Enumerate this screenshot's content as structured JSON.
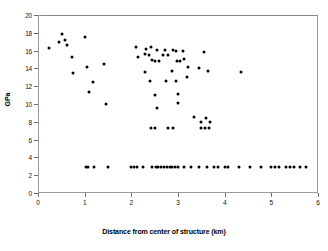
{
  "chart_data": {
    "type": "scatter",
    "title": "",
    "xlabel": "Distance from center of structure (km)",
    "ylabel": "GPa",
    "xlim": [
      0,
      6
    ],
    "ylim": [
      0,
      20
    ],
    "xticks": [
      0,
      1,
      2,
      3,
      4,
      5,
      6
    ],
    "yticks": [
      0,
      2,
      4,
      6,
      8,
      10,
      12,
      14,
      16,
      18,
      20
    ],
    "grid": false,
    "legend": null,
    "marker": "filled-circle",
    "marker_color": "#000000",
    "series": [
      {
        "name": "shock pressure",
        "points": [
          [
            0.24,
            16.25
          ],
          [
            0.46,
            17.0
          ],
          [
            0.52,
            17.9
          ],
          [
            0.58,
            17.15
          ],
          [
            0.62,
            16.6
          ],
          [
            0.72,
            15.25
          ],
          [
            0.74,
            13.45
          ],
          [
            1.0,
            17.55
          ],
          [
            1.05,
            14.15
          ],
          [
            1.1,
            11.4
          ],
          [
            1.18,
            12.5
          ],
          [
            1.42,
            14.45
          ],
          [
            1.45,
            10.0
          ],
          [
            2.1,
            16.4
          ],
          [
            2.15,
            15.25
          ],
          [
            2.3,
            15.6
          ],
          [
            2.32,
            16.2
          ],
          [
            2.38,
            15.55
          ],
          [
            2.42,
            16.45
          ],
          [
            2.45,
            14.9
          ],
          [
            2.5,
            14.85
          ],
          [
            2.55,
            16.1
          ],
          [
            2.6,
            14.85
          ],
          [
            2.68,
            15.55
          ],
          [
            2.72,
            16.1
          ],
          [
            2.78,
            15.55
          ],
          [
            2.9,
            16.1
          ],
          [
            2.95,
            15.95
          ],
          [
            2.98,
            14.85
          ],
          [
            3.05,
            14.85
          ],
          [
            3.1,
            16.0
          ],
          [
            3.12,
            15.1
          ],
          [
            3.55,
            15.85
          ],
          [
            2.3,
            13.6
          ],
          [
            2.4,
            12.6
          ],
          [
            2.5,
            11.0
          ],
          [
            2.75,
            12.6
          ],
          [
            2.88,
            13.7
          ],
          [
            2.95,
            12.55
          ],
          [
            3.0,
            11.15
          ],
          [
            3.2,
            13.05
          ],
          [
            3.22,
            14.15
          ],
          [
            3.45,
            14.0
          ],
          [
            3.65,
            13.75
          ],
          [
            4.35,
            13.6
          ],
          [
            2.55,
            9.55
          ],
          [
            3.0,
            10.1
          ],
          [
            3.35,
            8.55
          ],
          [
            3.5,
            7.95
          ],
          [
            3.6,
            8.4
          ],
          [
            3.68,
            7.95
          ],
          [
            2.42,
            7.35
          ],
          [
            2.5,
            7.35
          ],
          [
            2.78,
            7.35
          ],
          [
            2.9,
            7.35
          ],
          [
            3.5,
            7.35
          ],
          [
            3.58,
            7.35
          ],
          [
            3.66,
            7.35
          ],
          [
            1.02,
            2.95
          ],
          [
            1.08,
            2.95
          ],
          [
            1.2,
            2.95
          ],
          [
            1.5,
            2.95
          ],
          [
            2.0,
            2.95
          ],
          [
            2.06,
            2.95
          ],
          [
            2.12,
            2.95
          ],
          [
            2.25,
            2.95
          ],
          [
            2.45,
            2.95
          ],
          [
            2.52,
            2.95
          ],
          [
            2.58,
            2.95
          ],
          [
            2.64,
            2.95
          ],
          [
            2.7,
            2.95
          ],
          [
            2.76,
            2.95
          ],
          [
            2.82,
            2.95
          ],
          [
            2.88,
            2.95
          ],
          [
            2.94,
            2.95
          ],
          [
            3.0,
            2.95
          ],
          [
            3.12,
            2.95
          ],
          [
            3.28,
            2.95
          ],
          [
            3.45,
            2.95
          ],
          [
            3.62,
            2.95
          ],
          [
            3.78,
            2.95
          ],
          [
            3.86,
            2.95
          ],
          [
            4.0,
            2.95
          ],
          [
            4.08,
            2.95
          ],
          [
            4.3,
            2.95
          ],
          [
            4.55,
            2.95
          ],
          [
            4.78,
            2.95
          ],
          [
            5.0,
            2.95
          ],
          [
            5.08,
            2.95
          ],
          [
            5.16,
            2.95
          ],
          [
            5.32,
            2.95
          ],
          [
            5.4,
            2.95
          ],
          [
            5.48,
            2.95
          ],
          [
            5.62,
            2.95
          ],
          [
            5.75,
            2.95
          ]
        ]
      }
    ]
  }
}
